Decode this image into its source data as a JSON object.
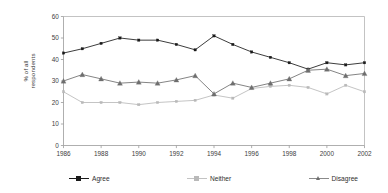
{
  "chart_data": {
    "type": "line",
    "title": "",
    "xlabel": "",
    "ylabel": "% of all\nrespondents",
    "ylabel_line1": "% of all",
    "ylabel_line2": "respondents",
    "ylim": [
      0,
      60
    ],
    "ytick_step": 10,
    "yticks": [
      "0",
      "10",
      "20",
      "30",
      "40",
      "50",
      "60"
    ],
    "ytick_values": [
      0,
      10,
      20,
      30,
      40,
      50,
      60
    ],
    "xlim": [
      1986,
      2002
    ],
    "xticks": [
      "1986",
      "1988",
      "1990",
      "1992",
      "1994",
      "1996",
      "1998",
      "2000",
      "2002"
    ],
    "xtick_values": [
      1986,
      1988,
      1990,
      1992,
      1994,
      1996,
      1998,
      2000,
      2002
    ],
    "x": [
      1986,
      1987,
      1988,
      1989,
      1990,
      1991,
      1992,
      1993,
      1994,
      1995,
      1996,
      1997,
      1998,
      1999,
      2000,
      2001,
      2002
    ],
    "grid": false,
    "legend_position": "bottom",
    "series": [
      {
        "name": "Agree",
        "color": "#1a1a1a",
        "marker": "square",
        "values": [
          43.0,
          45.0,
          47.5,
          50.0,
          49.0,
          49.0,
          47.0,
          44.5,
          51.0,
          47.0,
          43.5,
          41.0,
          38.5,
          35.5,
          38.5,
          37.5,
          38.5
        ]
      },
      {
        "name": "Neither",
        "color": "#b9b9b9",
        "marker": "square",
        "values": [
          25.0,
          20.0,
          20.0,
          20.0,
          19.0,
          20.0,
          20.5,
          21.0,
          23.5,
          22.0,
          26.5,
          27.5,
          28.0,
          27.0,
          24.0,
          28.0,
          25.0
        ]
      },
      {
        "name": "Disagree",
        "color": "#6e6e6e",
        "marker": "triangle",
        "values": [
          30.0,
          33.0,
          31.0,
          29.0,
          29.5,
          29.0,
          30.5,
          32.5,
          24.0,
          29.0,
          27.0,
          29.0,
          31.0,
          35.0,
          35.5,
          32.5,
          33.5
        ]
      }
    ]
  },
  "legend": {
    "items": [
      {
        "label": "Agree"
      },
      {
        "label": "Neither"
      },
      {
        "label": "Disagree"
      }
    ]
  }
}
